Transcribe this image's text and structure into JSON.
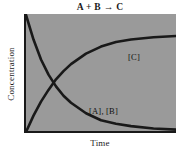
{
  "chart_data": {
    "type": "line",
    "title": "A + B → C",
    "xlabel": "Time",
    "ylabel": "Concentration",
    "grid": false,
    "legend_position": "inline-annotations",
    "xlim": [
      0,
      1
    ],
    "ylim": [
      0,
      1
    ],
    "axis_ticks": {
      "x": [],
      "y": []
    },
    "annotations": [
      {
        "text": "[C]",
        "x": 0.69,
        "y": 0.7
      },
      {
        "text": "[A], [B]",
        "x": 0.43,
        "y": 0.24
      }
    ],
    "series": [
      {
        "name": "[A], [B]",
        "label": "[A], [B]",
        "color": "#191919",
        "description": "exponential decay from high initial concentration toward zero",
        "x": [
          0.0,
          0.05,
          0.1,
          0.15,
          0.2,
          0.25,
          0.3,
          0.4,
          0.5,
          0.6,
          0.7,
          0.85,
          1.0
        ],
        "y": [
          1.0,
          0.79,
          0.62,
          0.49,
          0.39,
          0.31,
          0.25,
          0.16,
          0.1,
          0.07,
          0.05,
          0.03,
          0.02
        ]
      },
      {
        "name": "[C]",
        "label": "[C]",
        "color": "#191919",
        "description": "exponential rise from zero toward a plateau",
        "x": [
          0.0,
          0.05,
          0.1,
          0.15,
          0.2,
          0.25,
          0.3,
          0.4,
          0.5,
          0.6,
          0.7,
          0.85,
          1.0
        ],
        "y": [
          0.0,
          0.14,
          0.26,
          0.36,
          0.45,
          0.52,
          0.58,
          0.67,
          0.73,
          0.77,
          0.79,
          0.81,
          0.82
        ]
      }
    ],
    "crossing_point": {
      "x": 0.145,
      "y": 0.355
    },
    "colors": {
      "plot_background": "#9a9a9a",
      "page_background": "#ffffff",
      "axis": "#191919",
      "curve": "#191919",
      "text": "#1a1a1a"
    }
  }
}
